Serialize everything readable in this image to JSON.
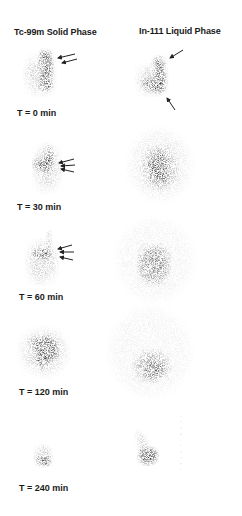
{
  "figure": {
    "columns": [
      {
        "label": "Tc-99m Solid Phase"
      },
      {
        "label": "In-111 Liquid Phase"
      }
    ],
    "rows": [
      {
        "time_label": "T = 0 min",
        "solid_arrows": 2,
        "liquid_arrows": 2
      },
      {
        "time_label": "T =  30 min",
        "solid_arrows": 3,
        "liquid_arrows": 0
      },
      {
        "time_label": "T = 60 min",
        "solid_arrows": 3,
        "liquid_arrows": 0
      },
      {
        "time_label": "T = 120 min",
        "solid_arrows": 0,
        "liquid_arrows": 0
      },
      {
        "time_label": "T = 240 min",
        "solid_arrows": 0,
        "liquid_arrows": 0
      }
    ]
  }
}
